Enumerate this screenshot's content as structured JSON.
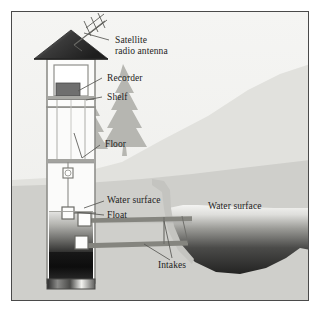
{
  "figure": {
    "background_color": "#f2f2f0",
    "frame_color": "#4a4a4a"
  },
  "labels": [
    {
      "id": "satellite-radio-antenna",
      "text": "Satellite\nradio antenna",
      "x": 103,
      "y": 28
    },
    {
      "id": "recorder",
      "text": "Recorder",
      "x": 95,
      "y": 68
    },
    {
      "id": "shelf",
      "text": "Shelf",
      "x": 95,
      "y": 89
    },
    {
      "id": "floor",
      "text": "Floor",
      "x": 93,
      "y": 133
    },
    {
      "id": "water-surface-well",
      "text": "Water surface",
      "x": 96,
      "y": 185
    },
    {
      "id": "float",
      "text": "Float",
      "x": 96,
      "y": 204
    },
    {
      "id": "water-surface-river",
      "text": "Water surface",
      "x": 203,
      "y": 195
    },
    {
      "id": "intakes",
      "text": "Intakes",
      "x": 148,
      "y": 254
    }
  ],
  "colors": {
    "sky": "#f2f2f0",
    "far_hill": "#dededa",
    "near_bank": "#c9c9c5",
    "tree": "#b3b3ae",
    "roof_dark": "#2f2f2f",
    "roof_light": "#cfcfcf",
    "well_wall": "#9a9a96",
    "well_interior": "#fbfbfa",
    "recorder_box": "#6e6e6e",
    "water_light": "#e8e8e6",
    "water_dark": "#2a2a2a",
    "sediment_dark": "#141414",
    "pipe": "#7a7a76",
    "leader_line": "#5a5a57",
    "text": "#1d1d1d"
  },
  "diagram_parts": [
    {
      "name": "satellite-radio-antenna",
      "description": "Yagi antenna on diagonal mast above roof"
    },
    {
      "name": "gauge-house-roof",
      "description": "Dark pyramidal roof with gradient"
    },
    {
      "name": "gauge-house",
      "description": "Instrument shelter on top of stilling well"
    },
    {
      "name": "recorder",
      "description": "Dark box mounted on shelf inside house"
    },
    {
      "name": "shelf",
      "description": "Horizontal platform under recorder"
    },
    {
      "name": "floor",
      "description": "Horizontal floor line in the well shaft"
    },
    {
      "name": "float-tape",
      "description": "Vertical tape from pulley to float"
    },
    {
      "name": "pulley",
      "description": "Small pulley wheel on tape below floor"
    },
    {
      "name": "float",
      "description": "Float resting at water surface inside well"
    },
    {
      "name": "intake-pipe-upper",
      "description": "Upper intake pipe from well to river"
    },
    {
      "name": "intake-pipe-lower",
      "description": "Lower intake pipe from well to river"
    },
    {
      "name": "stilling-well",
      "description": "Tall vertical shaft below the gauge house"
    },
    {
      "name": "river-channel",
      "description": "Dark water basin at right"
    },
    {
      "name": "trees",
      "description": "Two conifer silhouettes on hillside"
    }
  ]
}
